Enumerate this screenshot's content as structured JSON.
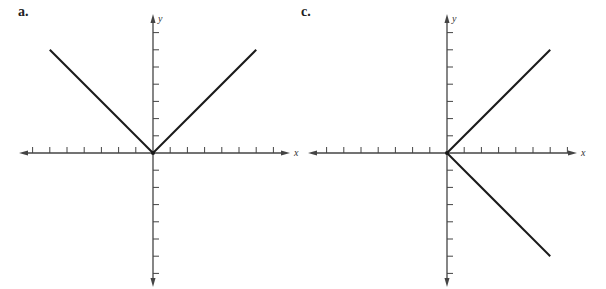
{
  "chart_data": [
    {
      "type": "line",
      "label": "a.",
      "xlabel": "x",
      "ylabel": "y",
      "xlim": [
        -7,
        7
      ],
      "ylim": [
        -7,
        7
      ],
      "grid": false,
      "tick_spacing": 1,
      "tick_labels": false,
      "series": [
        {
          "name": "left-branch",
          "points": [
            [
              -6,
              6
            ],
            [
              0,
              0
            ]
          ]
        },
        {
          "name": "right-branch",
          "points": [
            [
              0,
              0
            ],
            [
              6,
              6
            ]
          ]
        }
      ]
    },
    {
      "type": "line",
      "label": "c.",
      "xlabel": "x",
      "ylabel": "y",
      "xlim": [
        -7,
        7
      ],
      "ylim": [
        -7,
        7
      ],
      "grid": false,
      "tick_spacing": 1,
      "tick_labels": false,
      "series": [
        {
          "name": "upper-branch",
          "points": [
            [
              0,
              0
            ],
            [
              6,
              6
            ]
          ]
        },
        {
          "name": "lower-branch",
          "points": [
            [
              0,
              0
            ],
            [
              6,
              -6
            ]
          ]
        }
      ]
    }
  ],
  "panels": {
    "a": {
      "label": "a.",
      "xlabel": "x",
      "ylabel": "y"
    },
    "c": {
      "label": "c.",
      "xlabel": "x",
      "ylabel": "y"
    }
  }
}
